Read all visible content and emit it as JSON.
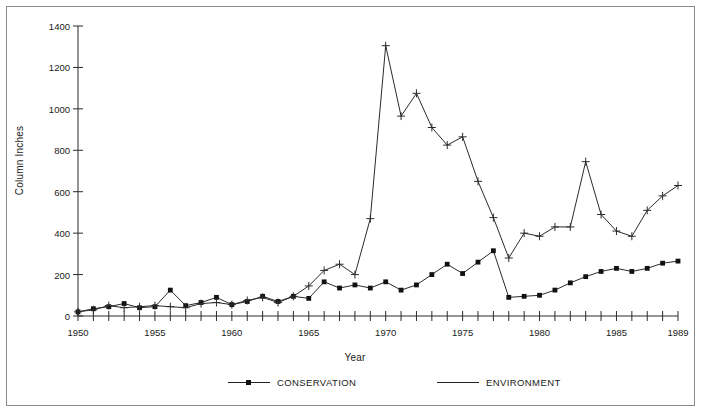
{
  "chart_data": {
    "type": "line",
    "title": "",
    "xlabel": "Year",
    "ylabel": "Column Inches",
    "xlim": [
      1950,
      1989
    ],
    "ylim": [
      0,
      1400
    ],
    "yticks": [
      0,
      200,
      400,
      600,
      800,
      1000,
      1200,
      1400
    ],
    "ytick_labels": [
      "0",
      "200",
      "400",
      "600",
      "800",
      "1000",
      "1200",
      "1400"
    ],
    "xticks": [
      1950,
      1955,
      1960,
      1965,
      1970,
      1975,
      1980,
      1985,
      1989
    ],
    "xtick_labels": [
      "1950",
      "1955",
      "1960",
      "1965",
      "1970",
      "1975",
      "1980",
      "1985",
      "1989"
    ],
    "x_minor_ticks_every": 1,
    "grid": false,
    "legend_position": "bottom",
    "x": [
      1950,
      1951,
      1952,
      1953,
      1954,
      1955,
      1956,
      1957,
      1958,
      1959,
      1960,
      1961,
      1962,
      1963,
      1964,
      1965,
      1966,
      1967,
      1968,
      1969,
      1970,
      1971,
      1972,
      1973,
      1974,
      1975,
      1976,
      1977,
      1978,
      1979,
      1980,
      1981,
      1982,
      1983,
      1984,
      1985,
      1986,
      1987,
      1988,
      1989
    ],
    "series": [
      {
        "name": "CONSERVATION",
        "marker": "square",
        "values": [
          20,
          35,
          45,
          60,
          40,
          45,
          125,
          50,
          65,
          90,
          55,
          70,
          95,
          70,
          95,
          85,
          165,
          135,
          150,
          135,
          165,
          125,
          150,
          200,
          250,
          205,
          260,
          315,
          90,
          95,
          100,
          125,
          160,
          190,
          215,
          230,
          215,
          230,
          255,
          265
        ]
      },
      {
        "name": "ENVIRONMENT",
        "marker": "plus",
        "values": [
          20,
          30,
          50,
          40,
          45,
          50,
          45,
          40,
          60,
          65,
          55,
          75,
          90,
          65,
          95,
          145,
          220,
          250,
          200,
          470,
          1305,
          965,
          1075,
          910,
          825,
          865,
          650,
          475,
          280,
          400,
          385,
          430,
          430,
          745,
          490,
          410,
          385,
          510,
          580,
          630
        ]
      }
    ]
  },
  "legend": {
    "entries": [
      {
        "label": "CONSERVATION"
      },
      {
        "label": "ENVIRONMENT"
      }
    ]
  },
  "axes": {
    "x_title": "Year",
    "y_title": "Column Inches"
  }
}
